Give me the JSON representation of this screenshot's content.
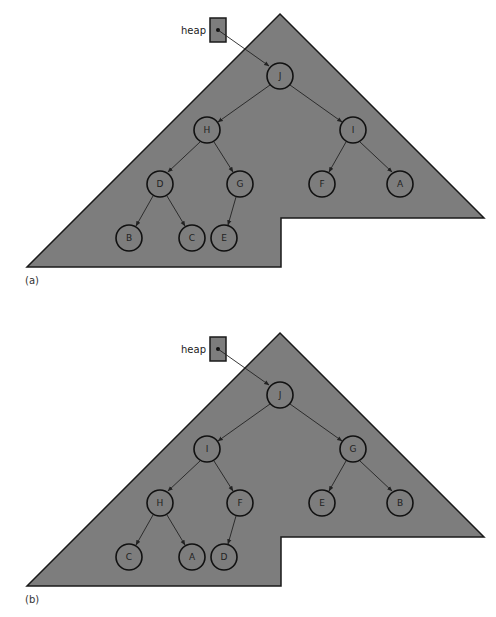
{
  "figure": {
    "panels": [
      {
        "caption": "(a)",
        "heap_label": "heap",
        "nodes": {
          "root": "J",
          "l": "H",
          "r": "I",
          "ll": "D",
          "lr": "G",
          "rl": "F",
          "rr": "A",
          "lll": "B",
          "llr": "C",
          "lrl": "E"
        },
        "level_order": [
          "J",
          "H",
          "I",
          "D",
          "G",
          "F",
          "A",
          "B",
          "C",
          "E"
        ]
      },
      {
        "caption": "(b)",
        "heap_label": "heap",
        "nodes": {
          "root": "J",
          "l": "I",
          "r": "G",
          "ll": "H",
          "lr": "F",
          "rl": "E",
          "rr": "B",
          "lll": "C",
          "llr": "A",
          "lrl": "D"
        },
        "level_order": [
          "J",
          "I",
          "G",
          "H",
          "F",
          "E",
          "B",
          "C",
          "A",
          "D"
        ]
      }
    ],
    "colors": {
      "fill": "#7d7d7d",
      "stroke": "#111111",
      "background": "#ffffff"
    }
  }
}
